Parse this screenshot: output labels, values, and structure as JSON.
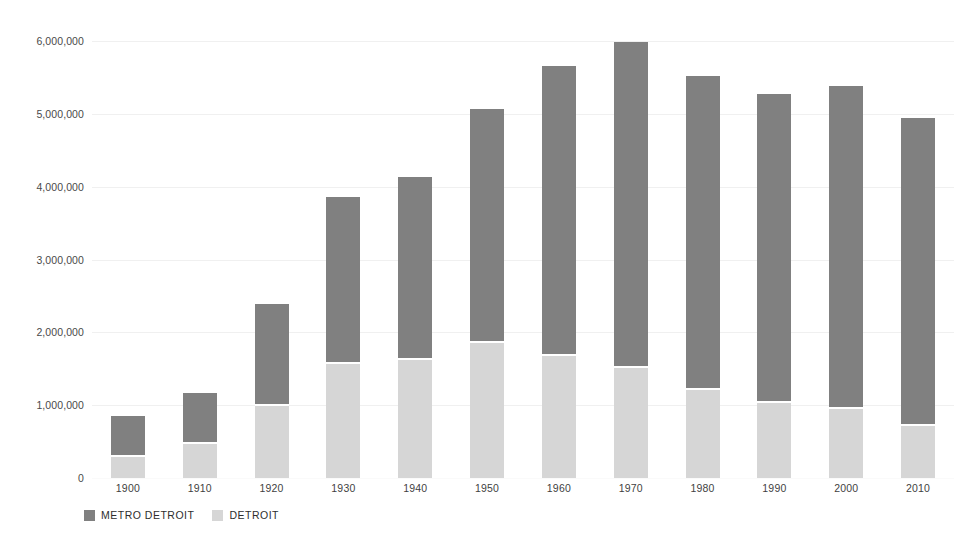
{
  "chart_data": {
    "type": "bar",
    "stacked": true,
    "title": "",
    "subtitle": "",
    "xlabel": "",
    "ylabel": "",
    "categories": [
      "1900",
      "1910",
      "1920",
      "1930",
      "1940",
      "1950",
      "1960",
      "1970",
      "1980",
      "1990",
      "2000",
      "2010"
    ],
    "series": [
      {
        "name": "METRO DETROIT",
        "color": "#808080",
        "values": [
          570000,
          705000,
          1390000,
          2290000,
          2510000,
          3220000,
          3990000,
          4480000,
          4320000,
          4240000,
          4430000,
          4230000
        ]
      },
      {
        "name": "DETROIT",
        "color": "#d6d6d6",
        "values": [
          286000,
          466000,
          994000,
          1569000,
          1623000,
          1850000,
          1670000,
          1511000,
          1203000,
          1028000,
          951000,
          714000
        ]
      }
    ],
    "totals": [
      856000,
      1171000,
      2384000,
      3859000,
      4133000,
      5070000,
      5660000,
      5991000,
      5523000,
      5268000,
      5381000,
      4944000
    ],
    "ylim": [
      0,
      6000000
    ],
    "yticks": [
      0,
      1000000,
      2000000,
      3000000,
      4000000,
      5000000,
      6000000
    ],
    "ytick_labels": [
      "0",
      "1,000,000",
      "2,000,000",
      "3,000,000",
      "4,000,000",
      "5,000,000",
      "6,000,000"
    ],
    "grid": true,
    "grid_axis": "y",
    "legend_position": "bottom-left",
    "legend": [
      {
        "label": "METRO DETROIT",
        "color": "#808080",
        "swatch": "legend-swatch-metro-detroit"
      },
      {
        "label": "DETROIT",
        "color": "#d6d6d6",
        "swatch": "legend-swatch-detroit"
      }
    ],
    "background": "#ffffff",
    "gridline_color": "#f0f0f0",
    "tick_label_color": "#4a4a4a"
  }
}
